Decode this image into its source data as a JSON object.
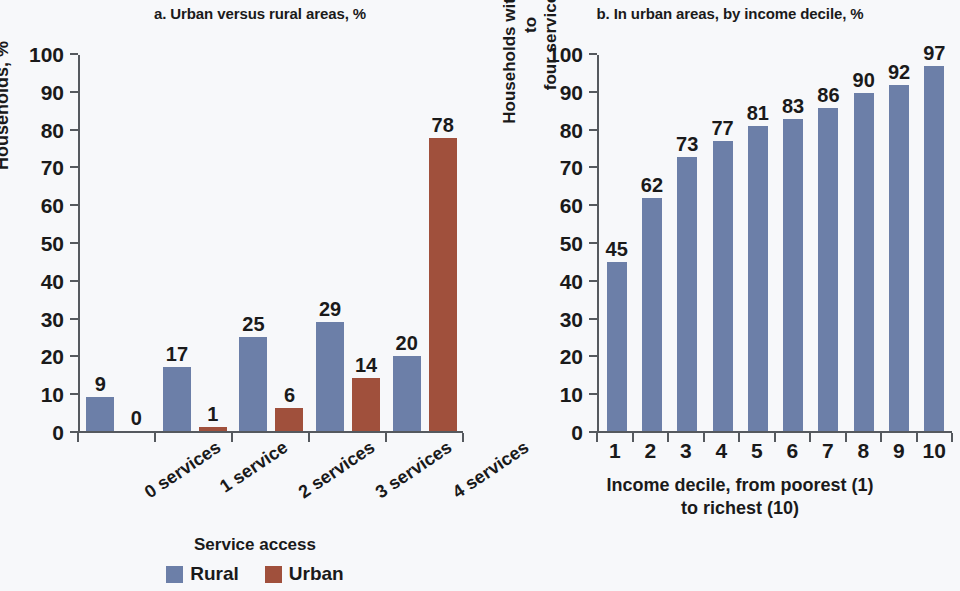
{
  "colors": {
    "rural": "#6c7fa8",
    "urban": "#a0503c",
    "axis": "#55595e",
    "text": "#1a1a1a",
    "background": "#f7f8fa"
  },
  "panel_a": {
    "title": "a. Urban versus rural areas, %",
    "ylabel": "Households, %",
    "xlabel": "Service access",
    "ytick_labels": [
      "0",
      "10",
      "20",
      "30",
      "40",
      "50",
      "60",
      "70",
      "80",
      "90",
      "100"
    ],
    "legend": [
      {
        "label": "Rural",
        "color": "#6c7fa8"
      },
      {
        "label": "Urban",
        "color": "#a0503c"
      }
    ]
  },
  "panel_b": {
    "title": "b. In urban areas, by income decile, %",
    "ylabel_line1": "Households with access to",
    "ylabel_line2": "four services, %",
    "xlabel_line1": "Income decile, from poorest (1)",
    "xlabel_line2": "to richest (10)",
    "ytick_labels": [
      "0",
      "10",
      "20",
      "30",
      "40",
      "50",
      "60",
      "70",
      "80",
      "90",
      "100"
    ]
  },
  "chart_data": [
    {
      "type": "bar",
      "title": "a. Urban versus rural areas, %",
      "xlabel": "Service access",
      "ylabel": "Households, %",
      "categories": [
        "0 services",
        "1 service",
        "2 services",
        "3 services",
        "4 services"
      ],
      "series": [
        {
          "name": "Rural",
          "color": "#6c7fa8",
          "values": [
            9,
            17,
            25,
            29,
            20
          ]
        },
        {
          "name": "Urban",
          "color": "#a0503c",
          "values": [
            0,
            1,
            6,
            14,
            78
          ]
        }
      ],
      "ylim": [
        0,
        100
      ],
      "ytick_step": 10,
      "grid": false,
      "legend_position": "bottom"
    },
    {
      "type": "bar",
      "title": "b. In urban areas, by income decile, %",
      "xlabel": "Income decile, from poorest (1) to richest (10)",
      "ylabel": "Households with access to four services, %",
      "categories": [
        "1",
        "2",
        "3",
        "4",
        "5",
        "6",
        "7",
        "8",
        "9",
        "10"
      ],
      "series": [
        {
          "name": "Urban households with access to four services",
          "color": "#6c7fa8",
          "values": [
            45,
            62,
            73,
            77,
            81,
            83,
            86,
            90,
            92,
            97
          ]
        }
      ],
      "ylim": [
        0,
        100
      ],
      "ytick_step": 10,
      "grid": false,
      "legend_position": "none"
    }
  ]
}
